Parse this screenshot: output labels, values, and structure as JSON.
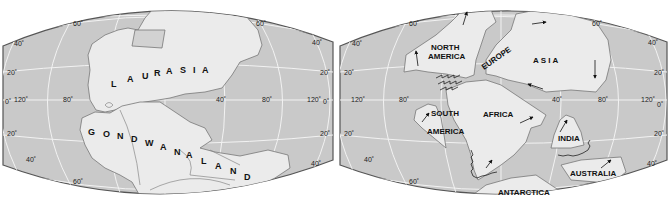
{
  "colors": {
    "ocean": "#c9c9c9",
    "land": "#ebebeb",
    "grid": "#f4f4f4",
    "outline": "#555555",
    "text": "#111111"
  },
  "maps": [
    {
      "id": "pangaea",
      "labels": {
        "laurasia": [
          "L",
          "A",
          "U",
          "R",
          "A",
          "S",
          "I",
          "A"
        ],
        "gondwanaland": [
          "G",
          "O",
          "N",
          "D",
          "W",
          "A",
          "N",
          "A",
          "L",
          "A",
          "N",
          "D"
        ]
      },
      "latitudes": {
        "n60": "60˚",
        "n40": "40˚",
        "n20": "20˚",
        "eq": "0˚",
        "s20": "20˚",
        "s40": "40˚",
        "s60": "60˚"
      },
      "longitudes": {
        "w120": "120˚",
        "w80": "80˚",
        "e40": "40˚",
        "e80": "80˚",
        "e120": "120˚"
      }
    },
    {
      "id": "continents",
      "labels": {
        "north_america_1": "NORTH",
        "north_america_2": "AMERICA",
        "europe": "EUROPE",
        "asia": "A S I A",
        "africa": "AFRICA",
        "south_america_1": "SOUTH",
        "south_america_2": "AMERICA",
        "india": "INDIA",
        "australia": "AUSTRALIA",
        "antarctica": "ANTARCTICA"
      },
      "latitudes": {
        "n60": "60˚",
        "n40": "40˚",
        "n20": "20˚",
        "eq": "0˚",
        "s20": "20˚",
        "s40": "40˚",
        "s60": "60˚"
      },
      "longitudes": {
        "w120": "120˚",
        "w80": "80˚",
        "e40": "40˚",
        "e80": "80˚",
        "e120": "120˚"
      },
      "arrows": [
        "north-america-west-arrow",
        "north-america-north-arrow",
        "asia-east-arrow",
        "asia-south-arrow",
        "asia-west-arrow",
        "south-america-arrow",
        "africa-east-arrow",
        "africa-south-arrow",
        "india-arrow",
        "australia-arrow"
      ]
    }
  ]
}
